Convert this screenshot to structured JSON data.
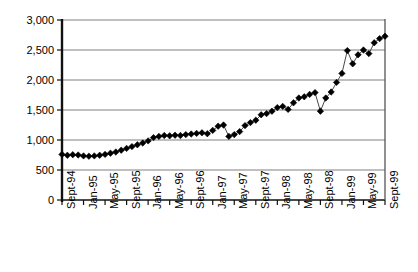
{
  "chart_data": {
    "type": "line",
    "title": "",
    "subtitle": "",
    "xlabel": "",
    "ylabel": "",
    "ylim": [
      0,
      3000
    ],
    "ytick_step": 500,
    "ytick_labels": [
      "0",
      "500",
      "1,000",
      "1,500",
      "2,000",
      "2,500",
      "3,000"
    ],
    "ytick_values": [
      0,
      500,
      1000,
      1500,
      2000,
      2500,
      3000
    ],
    "grid": true,
    "grid_axis": "y",
    "legend": false,
    "legend_position": "none",
    "marker": "filled-diamond",
    "marker_color": "#000000",
    "line_color": "#333333",
    "xtick_labels": [
      "Sept-94",
      "Jan-95",
      "May-95",
      "Sept-95",
      "Jan-96",
      "May-96",
      "Sept-96",
      "Jan-97",
      "May-97",
      "Sept-97",
      "Jan-98",
      "May-98",
      "Sept-98",
      "Jan-99",
      "May-99",
      "Sept-99"
    ],
    "xtick_interval_months": 4,
    "x_rotation_deg": -90,
    "x_start": "Sept-94",
    "x_end": "Sept-99",
    "x_frequency": "monthly",
    "x": [
      "Sept-94",
      "Oct-94",
      "Nov-94",
      "Dec-94",
      "Jan-95",
      "Feb-95",
      "Mar-95",
      "Apr-95",
      "May-95",
      "Jun-95",
      "Jul-95",
      "Aug-95",
      "Sept-95",
      "Oct-95",
      "Nov-95",
      "Dec-95",
      "Jan-96",
      "Feb-96",
      "Mar-96",
      "Apr-96",
      "May-96",
      "Jun-96",
      "Jul-96",
      "Aug-96",
      "Sept-96",
      "Oct-96",
      "Nov-96",
      "Dec-96",
      "Jan-97",
      "Feb-97",
      "Mar-97",
      "Apr-97",
      "May-97",
      "Jun-97",
      "Jul-97",
      "Aug-97",
      "Sept-97",
      "Oct-97",
      "Nov-97",
      "Dec-97",
      "Jan-98",
      "Feb-98",
      "Mar-98",
      "Apr-98",
      "May-98",
      "Jun-98",
      "Jul-98",
      "Aug-98",
      "Sept-98",
      "Oct-98",
      "Nov-98",
      "Dec-98",
      "Jan-99",
      "Feb-99",
      "Mar-99",
      "Apr-99",
      "May-99",
      "Jun-99",
      "Jul-99",
      "Aug-99",
      "Sept-99"
    ],
    "values": [
      760,
      745,
      755,
      750,
      735,
      730,
      735,
      745,
      760,
      780,
      800,
      830,
      860,
      890,
      920,
      950,
      985,
      1040,
      1060,
      1075,
      1070,
      1080,
      1075,
      1090,
      1100,
      1110,
      1120,
      1105,
      1160,
      1230,
      1250,
      1060,
      1090,
      1140,
      1240,
      1290,
      1330,
      1420,
      1440,
      1480,
      1540,
      1560,
      1510,
      1620,
      1700,
      1720,
      1760,
      1790,
      1480,
      1700,
      1800,
      1960,
      2110,
      2490,
      2270,
      2420,
      2500,
      2440,
      2620,
      2690,
      2730
    ]
  },
  "axes": {
    "plot_left_px": 62,
    "plot_right_px": 385,
    "plot_top_px": 20,
    "plot_bottom_px": 200
  }
}
